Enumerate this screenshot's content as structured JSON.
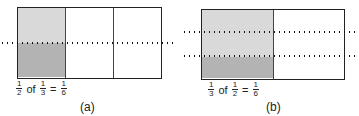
{
  "panels": [
    {
      "id": "a",
      "caption": "(a)",
      "equation": {
        "f1": {
          "num": "1",
          "den": "2"
        },
        "word": "of",
        "f2": {
          "num": "1",
          "den": "3"
        },
        "eq": "=",
        "f3": {
          "num": "1",
          "den": "6"
        }
      },
      "columns": 3,
      "rows_dotted": 2
    },
    {
      "id": "b",
      "caption": "(b)",
      "equation": {
        "f1": {
          "num": "1",
          "den": "3"
        },
        "word": "of",
        "f2": {
          "num": "1",
          "den": "2"
        },
        "eq": "=",
        "f3": {
          "num": "1",
          "den": "6"
        }
      },
      "columns": 2,
      "rows_dotted": 3
    }
  ],
  "colors": {
    "light_shade": "#d9d9d9",
    "dark_shade": "#b3b3b3",
    "line": "#222222"
  }
}
